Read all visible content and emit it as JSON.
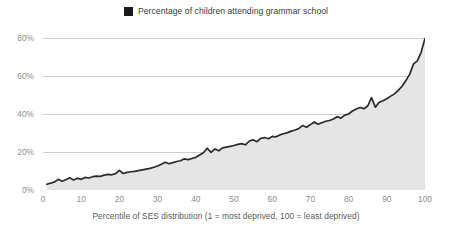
{
  "chart_data": {
    "type": "area",
    "title": "",
    "xlabel": "Percentile of SES distribution (1 = most deprived, 100 = least deprived)",
    "ylabel": "",
    "xlim": [
      0,
      100
    ],
    "ylim": [
      0,
      80
    ],
    "grid": true,
    "legend_position": "top-center",
    "legend": [
      {
        "name": "Percentage of children attending grammar school",
        "marker": "square",
        "color": "#1a1a1a"
      }
    ],
    "series_color_line": "#2a2a2a",
    "series_color_fill": "#e5e5e5",
    "gridline_color": "#c9c9c9",
    "axis_label_color": "#8d8d8d",
    "y_ticks": [
      0,
      20,
      40,
      60,
      80
    ],
    "y_tick_labels": [
      "0%",
      "20%",
      "40%",
      "60%",
      "80%"
    ],
    "x_ticks": [
      0,
      10,
      20,
      30,
      40,
      50,
      60,
      70,
      80,
      90,
      100
    ],
    "x_tick_labels": [
      "0",
      "10",
      "20",
      "30",
      "40",
      "50",
      "60",
      "70",
      "80",
      "90",
      "100"
    ],
    "series": [
      {
        "name": "Percentage of children attending grammar school",
        "x": [
          1,
          2,
          3,
          4,
          5,
          6,
          7,
          8,
          9,
          10,
          11,
          12,
          13,
          14,
          15,
          16,
          17,
          18,
          19,
          20,
          21,
          22,
          23,
          24,
          25,
          26,
          27,
          28,
          29,
          30,
          31,
          32,
          33,
          34,
          35,
          36,
          37,
          38,
          39,
          40,
          41,
          42,
          43,
          44,
          45,
          46,
          47,
          48,
          49,
          50,
          51,
          52,
          53,
          54,
          55,
          56,
          57,
          58,
          59,
          60,
          61,
          62,
          63,
          64,
          65,
          66,
          67,
          68,
          69,
          70,
          71,
          72,
          73,
          74,
          75,
          76,
          77,
          78,
          79,
          80,
          81,
          82,
          83,
          84,
          85,
          86,
          87,
          88,
          89,
          90,
          91,
          92,
          93,
          94,
          95,
          96,
          97,
          98,
          99,
          100
        ],
        "values": [
          3.0,
          3.6,
          4.2,
          5.6,
          4.6,
          5.4,
          6.4,
          5.3,
          6.2,
          5.6,
          6.6,
          6.3,
          7.0,
          7.3,
          7.2,
          7.8,
          8.2,
          8.0,
          8.6,
          10.3,
          8.7,
          9.3,
          9.6,
          9.8,
          10.2,
          10.6,
          11.0,
          11.4,
          12.0,
          12.6,
          13.6,
          14.6,
          13.8,
          14.4,
          15.0,
          15.4,
          16.4,
          16.0,
          16.6,
          17.2,
          18.4,
          19.6,
          22.0,
          19.8,
          21.6,
          20.6,
          22.2,
          22.6,
          23.0,
          23.4,
          24.0,
          24.4,
          23.8,
          25.8,
          26.4,
          25.4,
          27.2,
          27.6,
          27.0,
          28.2,
          28.0,
          29.0,
          29.6,
          30.2,
          31.0,
          31.6,
          32.4,
          34.0,
          33.0,
          34.4,
          35.8,
          34.6,
          35.4,
          36.2,
          36.6,
          37.4,
          38.6,
          37.8,
          39.4,
          40.0,
          41.6,
          42.6,
          43.4,
          42.8,
          44.2,
          48.6,
          43.6,
          46.2,
          47.0,
          48.0,
          49.4,
          50.6,
          52.4,
          54.6,
          57.6,
          61.0,
          66.4,
          68.0,
          72.6,
          79.8
        ]
      }
    ]
  }
}
